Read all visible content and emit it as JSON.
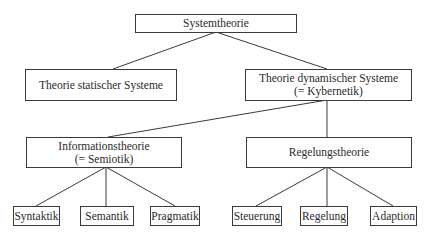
{
  "diagram": {
    "type": "tree",
    "title": "Systemtheorie",
    "nodes": {
      "root": {
        "label": "Systemtheorie"
      },
      "static": {
        "label": "Theorie statischer Systeme"
      },
      "dynamic": {
        "line1": "Theorie dynamischer Systeme",
        "line2": "(= Kybernetik)"
      },
      "information": {
        "line1": "Informationstheorie",
        "line2": "(= Semiotik)"
      },
      "control": {
        "label": "Regelungstheorie"
      },
      "syntaktik": {
        "label": "Syntaktik"
      },
      "semantik": {
        "label": "Semantik"
      },
      "pragmatik": {
        "label": "Pragmatik"
      },
      "steuerung": {
        "label": "Steuerung"
      },
      "regelung": {
        "label": "Regelung"
      },
      "adaption": {
        "label": "Adaption"
      }
    },
    "edges": [
      [
        "root",
        "static"
      ],
      [
        "root",
        "dynamic"
      ],
      [
        "dynamic",
        "information"
      ],
      [
        "dynamic",
        "control"
      ],
      [
        "information",
        "syntaktik"
      ],
      [
        "information",
        "semantik"
      ],
      [
        "information",
        "pragmatik"
      ],
      [
        "control",
        "steuerung"
      ],
      [
        "control",
        "regelung"
      ],
      [
        "control",
        "adaption"
      ]
    ],
    "colors": {
      "line": "#3a3a3a",
      "text": "#2a2a2a",
      "background": "#ffffff"
    }
  }
}
